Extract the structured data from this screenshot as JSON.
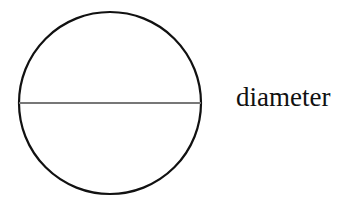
{
  "diagram": {
    "label": "diameter",
    "circle": {
      "cx": 110,
      "cy": 103,
      "r": 91,
      "stroke": "#111111"
    },
    "diameter_line": {
      "x1": 19,
      "x2": 201,
      "y": 103,
      "stroke": "#777777"
    }
  }
}
